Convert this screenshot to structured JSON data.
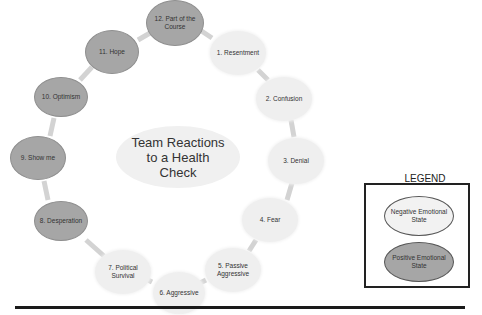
{
  "diagram": {
    "title": "Team Reactions to a Health Check",
    "title_lines": [
      "Team Reactions",
      "to a Health",
      "Check"
    ],
    "nodes": [
      {
        "id": 1,
        "label": "1. Resentment",
        "state": "negative"
      },
      {
        "id": 2,
        "label": "2. Confusion",
        "state": "negative"
      },
      {
        "id": 3,
        "label": "3. Denial",
        "state": "negative"
      },
      {
        "id": 4,
        "label": "4. Fear",
        "state": "negative"
      },
      {
        "id": 5,
        "label": "5. Passive Aggressive",
        "state": "negative"
      },
      {
        "id": 6,
        "label": "6. Aggressive",
        "state": "negative"
      },
      {
        "id": 7,
        "label": "7. Political Survival",
        "state": "negative"
      },
      {
        "id": 8,
        "label": "8. Desperation",
        "state": "positive"
      },
      {
        "id": 9,
        "label": "9. Show me",
        "state": "positive"
      },
      {
        "id": 10,
        "label": "10. Optimism",
        "state": "positive"
      },
      {
        "id": 11,
        "label": "11. Hope",
        "state": "positive"
      },
      {
        "id": 12,
        "label": "12. Part of the Course",
        "state": "positive"
      }
    ],
    "colors": {
      "negative_fill": "#efefef",
      "positive_fill": "#a6a6a6",
      "connector": "#d0d0d0"
    }
  },
  "legend": {
    "title": "LEGEND",
    "items": [
      {
        "label": "Negative Emotional State",
        "state": "negative"
      },
      {
        "label": "Positive Emotional State",
        "state": "positive"
      }
    ]
  }
}
